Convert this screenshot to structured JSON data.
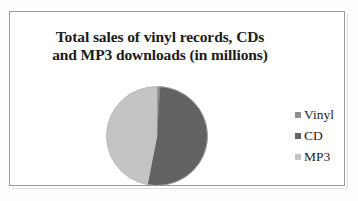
{
  "figure": {
    "title_lines": [
      "Total sales of vinyl records, CDs",
      "and MP3 downloads (in millions)"
    ],
    "title_full": "Total sales of vinyl records, CDs and MP3 downloads (in millions)"
  },
  "legend": {
    "items": [
      {
        "label": "Vinyl",
        "color": "#8f8f8f"
      },
      {
        "label": "CD",
        "color": "#636363"
      },
      {
        "label": "MP3",
        "color": "#c4c4c4"
      }
    ]
  },
  "chart_data": {
    "type": "pie",
    "title": "Total sales of vinyl records, CDs and MP3 downloads (in millions)",
    "categories": [
      "Vinyl",
      "CD",
      "MP3"
    ],
    "values": [
      1,
      52,
      47
    ],
    "unit": "percent",
    "colors": [
      "#8f8f8f",
      "#636363",
      "#c4c4c4"
    ],
    "start_angle_deg": 0,
    "direction": "clockwise",
    "legend_position": "right",
    "grid": false,
    "data_labels": false,
    "slices": [
      {
        "name": "Vinyl",
        "value": 1,
        "color": "#8f8f8f",
        "start_deg": 0,
        "end_deg": 4
      },
      {
        "name": "CD",
        "value": 52,
        "color": "#636363",
        "start_deg": 4,
        "end_deg": 191
      },
      {
        "name": "MP3",
        "value": 47,
        "color": "#c4c4c4",
        "start_deg": 191,
        "end_deg": 360
      }
    ]
  }
}
